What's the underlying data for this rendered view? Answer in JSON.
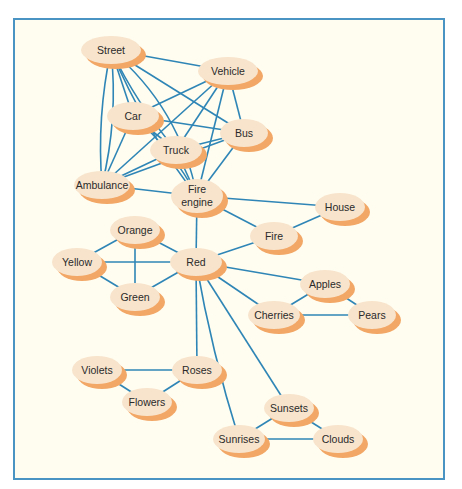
{
  "diagram": {
    "type": "semantic-network",
    "colors": {
      "frame_border": "#4a94c4",
      "background": "#fffdf0",
      "edge": "#2f86b6",
      "node_fill": "#f8e4cc",
      "node_shadow": "#f2a766"
    },
    "nodes": [
      {
        "id": "street",
        "label": "Street",
        "x": 111,
        "y": 50,
        "rx": 30,
        "ry": 14
      },
      {
        "id": "vehicle",
        "label": "Vehicle",
        "x": 228,
        "y": 71,
        "rx": 30,
        "ry": 14
      },
      {
        "id": "car",
        "label": "Car",
        "x": 133,
        "y": 116,
        "rx": 26,
        "ry": 14
      },
      {
        "id": "bus",
        "label": "Bus",
        "x": 244,
        "y": 133,
        "rx": 24,
        "ry": 14
      },
      {
        "id": "truck",
        "label": "Truck",
        "x": 176,
        "y": 150,
        "rx": 26,
        "ry": 14
      },
      {
        "id": "ambulance",
        "label": "Ambulance",
        "x": 102,
        "y": 185,
        "rx": 28,
        "ry": 14
      },
      {
        "id": "fire_engine",
        "label": "Fire\nengine",
        "x": 197,
        "y": 196,
        "rx": 26,
        "ry": 17
      },
      {
        "id": "house",
        "label": "House",
        "x": 340,
        "y": 207,
        "rx": 25,
        "ry": 14
      },
      {
        "id": "fire",
        "label": "Fire",
        "x": 274,
        "y": 236,
        "rx": 24,
        "ry": 14
      },
      {
        "id": "orange",
        "label": "Orange",
        "x": 135,
        "y": 230,
        "rx": 25,
        "ry": 14
      },
      {
        "id": "yellow",
        "label": "Yellow",
        "x": 77,
        "y": 262,
        "rx": 25,
        "ry": 14
      },
      {
        "id": "red",
        "label": "Red",
        "x": 196,
        "y": 262,
        "rx": 26,
        "ry": 14
      },
      {
        "id": "green",
        "label": "Green",
        "x": 135,
        "y": 297,
        "rx": 25,
        "ry": 14
      },
      {
        "id": "apples",
        "label": "Apples",
        "x": 325,
        "y": 284,
        "rx": 25,
        "ry": 14
      },
      {
        "id": "cherries",
        "label": "Cherries",
        "x": 274,
        "y": 315,
        "rx": 26,
        "ry": 14
      },
      {
        "id": "pears",
        "label": "Pears",
        "x": 372,
        "y": 315,
        "rx": 24,
        "ry": 14
      },
      {
        "id": "violets",
        "label": "Violets",
        "x": 97,
        "y": 370,
        "rx": 25,
        "ry": 14
      },
      {
        "id": "roses",
        "label": "Roses",
        "x": 197,
        "y": 370,
        "rx": 25,
        "ry": 14
      },
      {
        "id": "flowers",
        "label": "Flowers",
        "x": 147,
        "y": 402,
        "rx": 25,
        "ry": 14
      },
      {
        "id": "sunsets",
        "label": "Sunsets",
        "x": 289,
        "y": 408,
        "rx": 25,
        "ry": 14
      },
      {
        "id": "sunrises",
        "label": "Sunrises",
        "x": 239,
        "y": 439,
        "rx": 26,
        "ry": 14
      },
      {
        "id": "clouds",
        "label": "Clouds",
        "x": 338,
        "y": 439,
        "rx": 25,
        "ry": 14
      }
    ],
    "edges": [
      {
        "from": "street",
        "to": "vehicle",
        "curve": 0
      },
      {
        "from": "street",
        "to": "car",
        "curve": 0
      },
      {
        "from": "street",
        "to": "truck",
        "curve": 8
      },
      {
        "from": "street",
        "to": "bus",
        "curve": 0
      },
      {
        "from": "street",
        "to": "fire_engine",
        "curve": 12
      },
      {
        "from": "street",
        "to": "ambulance",
        "curve": -12
      },
      {
        "from": "street",
        "to": "fire_engine",
        "curve": -30
      },
      {
        "from": "street",
        "to": "ambulance",
        "curve": 10
      },
      {
        "from": "vehicle",
        "to": "car",
        "curve": 0
      },
      {
        "from": "vehicle",
        "to": "truck",
        "curve": 0
      },
      {
        "from": "vehicle",
        "to": "bus",
        "curve": 0
      },
      {
        "from": "vehicle",
        "to": "ambulance",
        "curve": 0
      },
      {
        "from": "vehicle",
        "to": "fire_engine",
        "curve": 0
      },
      {
        "from": "car",
        "to": "bus",
        "curve": 0
      },
      {
        "from": "car",
        "to": "truck",
        "curve": 0
      },
      {
        "from": "car",
        "to": "ambulance",
        "curve": 0
      },
      {
        "from": "car",
        "to": "fire_engine",
        "curve": -10
      },
      {
        "from": "truck",
        "to": "ambulance",
        "curve": 0
      },
      {
        "from": "truck",
        "to": "bus",
        "curve": 0
      },
      {
        "from": "truck",
        "to": "fire_engine",
        "curve": 0
      },
      {
        "from": "bus",
        "to": "ambulance",
        "curve": 0
      },
      {
        "from": "bus",
        "to": "fire_engine",
        "curve": 0
      },
      {
        "from": "ambulance",
        "to": "fire_engine",
        "curve": 0
      },
      {
        "from": "fire_engine",
        "to": "house",
        "curve": 0
      },
      {
        "from": "fire_engine",
        "to": "fire",
        "curve": 0
      },
      {
        "from": "fire_engine",
        "to": "red",
        "curve": 0
      },
      {
        "from": "house",
        "to": "fire",
        "curve": 0
      },
      {
        "from": "fire",
        "to": "red",
        "curve": 0
      },
      {
        "from": "orange",
        "to": "yellow",
        "curve": 0
      },
      {
        "from": "orange",
        "to": "green",
        "curve": 0
      },
      {
        "from": "orange",
        "to": "red",
        "curve": 0
      },
      {
        "from": "yellow",
        "to": "red",
        "curve": 0
      },
      {
        "from": "yellow",
        "to": "green",
        "curve": 0
      },
      {
        "from": "green",
        "to": "red",
        "curve": 0
      },
      {
        "from": "red",
        "to": "apples",
        "curve": 0
      },
      {
        "from": "red",
        "to": "cherries",
        "curve": 0
      },
      {
        "from": "red",
        "to": "roses",
        "curve": 0
      },
      {
        "from": "red",
        "to": "sunrises",
        "curve": 6
      },
      {
        "from": "red",
        "to": "sunsets",
        "curve": 0
      },
      {
        "from": "apples",
        "to": "cherries",
        "curve": 0
      },
      {
        "from": "apples",
        "to": "pears",
        "curve": 0
      },
      {
        "from": "cherries",
        "to": "pears",
        "curve": 0
      },
      {
        "from": "violets",
        "to": "roses",
        "curve": 0
      },
      {
        "from": "violets",
        "to": "flowers",
        "curve": 0
      },
      {
        "from": "roses",
        "to": "flowers",
        "curve": 0
      },
      {
        "from": "sunsets",
        "to": "sunrises",
        "curve": 0
      },
      {
        "from": "sunsets",
        "to": "clouds",
        "curve": 0
      },
      {
        "from": "sunrises",
        "to": "clouds",
        "curve": 0
      }
    ]
  }
}
